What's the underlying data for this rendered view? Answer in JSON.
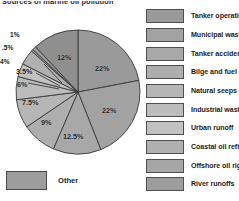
{
  "title": "Sources of marine oil pollution",
  "other": {
    "label": "Other",
    "color": "#9d9d9d"
  },
  "legend": {
    "items": [
      {
        "label": "Tanker operations",
        "color": "#9a9a9a"
      },
      {
        "label": "Municipal wastes",
        "color": "#a2a2a2"
      },
      {
        "label": "Tanker accidents",
        "color": "#a8a8a8"
      },
      {
        "label": "Bilge and fuel oils",
        "color": "#aeaeae"
      },
      {
        "label": "Natural seeps",
        "color": "#b6b6b6"
      },
      {
        "label": "Industrial waste",
        "color": "#bcbcbc"
      },
      {
        "label": "Urban runoff",
        "color": "#c2c2c2"
      },
      {
        "label": "Coastal oil refining",
        "color": "#b0b0b0"
      },
      {
        "label": "Offshore oil rigs",
        "color": "#a6a6a6"
      },
      {
        "label": "River runoffs",
        "color": "#9c9c9c"
      }
    ]
  },
  "chart_data": {
    "type": "pie",
    "title": "Sources of marine oil pollution",
    "unit": "%",
    "total": 100,
    "legend_position": "right",
    "categories": [
      "Tanker operations",
      "Municipal wastes",
      "Tanker accidents",
      "Bilge and fuel oils",
      "Natural seeps",
      "Industrial waste",
      "Urban runoff",
      "Coastal oil refining",
      "Offshore oil rigs",
      "River runoffs"
    ],
    "values": [
      22,
      22,
      12.5,
      9,
      7.5,
      6,
      3.5,
      4,
      0.5,
      1
    ],
    "labels": [
      "22%",
      "22%",
      "12.5%",
      "9%",
      "7.5%",
      "6%",
      "3.5%",
      "4%",
      ".5%",
      "1%"
    ],
    "extra_slice": {
      "label": "12%",
      "value": 12
    },
    "slice_labels_shown": [
      "12%",
      "22%",
      "22%",
      "12.5%",
      "9%",
      "7.5%",
      "6%",
      "3.5%",
      "4%",
      ".5%",
      "1%"
    ],
    "colors": [
      "#9a9a9a",
      "#a2a2a2",
      "#a8a8a8",
      "#aeaeae",
      "#b6b6b6",
      "#bcbcbc",
      "#c2c2c2",
      "#b0b0b0",
      "#a6a6a6",
      "#9c9c9c",
      "#8f8f8f"
    ]
  }
}
